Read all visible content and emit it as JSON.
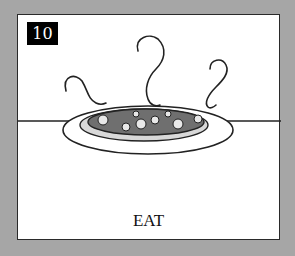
{
  "card": {
    "number": "10",
    "caption": "EAT",
    "illustration": "steaming-plate-of-food-icon"
  },
  "colors": {
    "background": "#a6a6a6",
    "card": "#ffffff",
    "badge": "#000000",
    "food": "#6f6f6f"
  }
}
